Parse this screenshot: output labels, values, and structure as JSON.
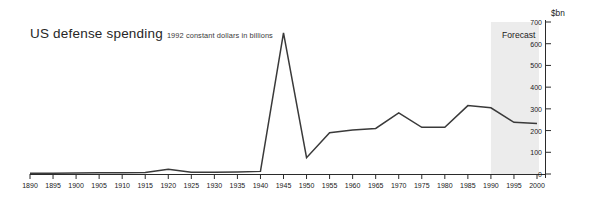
{
  "chart_data": {
    "type": "line",
    "title": "US defense spending",
    "subtitle": "1992 constant dollars in billions",
    "ylabel": "$bn",
    "xlabel": "",
    "xlim": [
      1890,
      2000
    ],
    "ylim": [
      0,
      700
    ],
    "grid": false,
    "legend": null,
    "annotations": [
      {
        "label": "Forecast",
        "type": "shaded-band",
        "x_start": 1990,
        "x_end": 2000
      }
    ],
    "xticks": [
      1890,
      1895,
      1900,
      1905,
      1910,
      1915,
      1920,
      1925,
      1930,
      1935,
      1940,
      1945,
      1950,
      1955,
      1960,
      1965,
      1970,
      1975,
      1980,
      1985,
      1990,
      1995,
      2000
    ],
    "yticks": [
      0,
      100,
      200,
      300,
      400,
      500,
      600,
      700
    ],
    "x": [
      1890,
      1895,
      1900,
      1905,
      1910,
      1915,
      1920,
      1925,
      1930,
      1935,
      1940,
      1945,
      1950,
      1955,
      1960,
      1965,
      1970,
      1975,
      1980,
      1985,
      1990,
      1995,
      2000
    ],
    "values": [
      3,
      4,
      5,
      6,
      6,
      7,
      22,
      8,
      8,
      9,
      12,
      650,
      75,
      190,
      203,
      210,
      281,
      215,
      215,
      315,
      305,
      238,
      232
    ],
    "series": [
      {
        "name": "US defense spending",
        "color": "#3a3a3a",
        "values": [
          3,
          4,
          5,
          6,
          6,
          7,
          22,
          8,
          8,
          9,
          12,
          650,
          75,
          190,
          203,
          210,
          281,
          215,
          215,
          315,
          305,
          238,
          232
        ]
      }
    ]
  },
  "labels": {
    "title": "US defense spending",
    "subtitle": "1992 constant dollars in billions",
    "y_unit": "$bn",
    "forecast": "Forecast"
  },
  "colors": {
    "line": "#3a3a3a",
    "axis": "#2b2b2b",
    "forecast_band": "#ececec",
    "background": "#ffffff"
  }
}
